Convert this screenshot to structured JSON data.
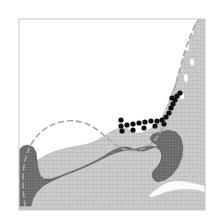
{
  "figure": {
    "domain_label": "map",
    "title": "Coastal bathymetry and transect map",
    "width": 218,
    "height": 224,
    "background_color": "#ffffff"
  },
  "frame": {
    "name": "map-frame",
    "x": 19,
    "y": 19,
    "width": 186,
    "height": 191,
    "stroke_color": "#cfcfcf",
    "stroke_width": 1.2,
    "fill_color": "#ffffff"
  },
  "layers": {
    "ocean": {
      "label": "ocean",
      "color": "#ffffff"
    },
    "land": {
      "label": "land",
      "color": "#c8c8c8",
      "texture_color": "#bdbdbd",
      "texture_opacity": 0.55
    },
    "shelf": {
      "label": "nearshore shelf zone",
      "color": "#6e6e6e"
    },
    "river": {
      "label": "river",
      "color": "#fbfbfb"
    },
    "contour": {
      "label": "offshore contour",
      "color": "#a8a8a8",
      "stroke_width": 1.6,
      "dash_pattern": "5 4"
    },
    "transect": {
      "label": "sampling transect",
      "color": "#101010",
      "dot_radius": 2.6,
      "dot_count": 22
    }
  },
  "geometry": {
    "land_path": "M 205 19 L 205 210 L 19 210 L 19 206 L 24 203 L 28 196 L 30 186 L 31 175 L 33 166 L 38 160 L 46 155 L 56 151 L 67 148 L 78 146 L 88 144 L 96 141 L 103 137 L 109 133 L 114 130 L 120 128 L 126 128 L 131 131 L 136 133 L 142 133 L 147 131 L 152 128 L 157 124 L 161 119 L 164 113 L 167 106 L 170 98 L 173 90 L 176 82 L 179 73 L 182 64 L 185 54 L 188 44 L 191 34 L 194 26 L 197 21 L 200 19 Z",
    "shelf_path": "M 19 206 L 19 150 L 23 146 L 28 145 L 33 147 L 36 152 L 37 160 L 38 168 L 40 175 L 44 179 L 51 179 L 60 176 L 70 172 L 80 168 L 89 164 L 97 160 L 104 156 L 110 152 L 116 149 L 122 147 L 128 147 L 133 149 L 138 151 L 144 151 L 150 149 L 155 147 L 160 145 L 164 142 L 167 139 L 170 135 L 173 133 L 176 133 L 179 136 L 181 141 L 182 148 L 181 156 L 178 164 L 173 171 L 167 176 L 161 179 L 156 180 L 153 178 L 152 174 L 154 170 L 158 166 L 161 161 L 162 155 L 160 150 L 156 147 L 150 146 L 143 147 L 136 149 L 129 150 L 122 151 L 115 153 L 108 156 L 100 160 L 92 164 L 83 168 L 73 172 L 63 176 L 52 181 L 43 186 L 37 192 L 33 199 L 31 206 Z",
    "shelf_bay_path": "M 160 132 L 168 130 L 176 132 L 181 138 L 183 147 L 182 157 L 178 167 L 172 175 L 165 180 L 158 182 L 154 180 L 153 175 L 156 170 L 160 164 L 162 157 L 161 150 L 157 145 L 152 142 L 150 138 L 153 134 Z",
    "river_path": "M 205 186 L 196 184 L 187 182 L 178 181 L 170 182 L 163 185 L 157 189 L 152 193 L 149 196 L 152 197 L 158 195 L 165 192 L 173 190 L 181 189 L 190 189 L 198 190 L 205 192 Z",
    "contour_path": "M 25 206 C 23 192 22 178 24 166 C 26 153 31 142 39 134 C 47 126 57 122 67 121 C 78 120 88 123 96 129 C 103 134 109 140 116 145 C 123 150 131 152 139 150 C 147 148 153 143 158 136 C 163 128 166 119 169 109 C 172 98 175 87 178 76 C 181 65 184 53 188 42 C 191 33 195 25 199 19"
  },
  "transect_points": [
    {
      "x": 121,
      "y": 126
    },
    {
      "x": 127,
      "y": 125
    },
    {
      "x": 133,
      "y": 124
    },
    {
      "x": 139,
      "y": 123
    },
    {
      "x": 145,
      "y": 122
    },
    {
      "x": 151,
      "y": 121
    },
    {
      "x": 157,
      "y": 121
    },
    {
      "x": 162,
      "y": 120
    },
    {
      "x": 166,
      "y": 117
    },
    {
      "x": 169,
      "y": 113
    },
    {
      "x": 171,
      "y": 108
    },
    {
      "x": 173,
      "y": 104
    },
    {
      "x": 175,
      "y": 100
    },
    {
      "x": 177,
      "y": 96
    },
    {
      "x": 180,
      "y": 93
    },
    {
      "x": 121,
      "y": 120
    },
    {
      "x": 122,
      "y": 131
    },
    {
      "x": 133,
      "y": 130
    },
    {
      "x": 144,
      "y": 128
    },
    {
      "x": 155,
      "y": 126
    },
    {
      "x": 164,
      "y": 124
    },
    {
      "x": 172,
      "y": 98
    }
  ],
  "land_texture_dots": [
    {
      "x": 40,
      "y": 196
    },
    {
      "x": 55,
      "y": 190
    },
    {
      "x": 70,
      "y": 185
    },
    {
      "x": 86,
      "y": 181
    },
    {
      "x": 101,
      "y": 178
    },
    {
      "x": 117,
      "y": 176
    },
    {
      "x": 132,
      "y": 174
    },
    {
      "x": 148,
      "y": 172
    },
    {
      "x": 163,
      "y": 170
    },
    {
      "x": 178,
      "y": 168
    },
    {
      "x": 193,
      "y": 166
    },
    {
      "x": 48,
      "y": 205
    },
    {
      "x": 64,
      "y": 201
    },
    {
      "x": 80,
      "y": 198
    },
    {
      "x": 96,
      "y": 195
    },
    {
      "x": 112,
      "y": 193
    },
    {
      "x": 128,
      "y": 191
    },
    {
      "x": 144,
      "y": 189
    },
    {
      "x": 160,
      "y": 187
    },
    {
      "x": 176,
      "y": 185
    },
    {
      "x": 192,
      "y": 183
    },
    {
      "x": 186,
      "y": 40
    },
    {
      "x": 194,
      "y": 52
    },
    {
      "x": 190,
      "y": 68
    },
    {
      "x": 198,
      "y": 84
    },
    {
      "x": 188,
      "y": 100
    },
    {
      "x": 196,
      "y": 116
    },
    {
      "x": 186,
      "y": 132
    },
    {
      "x": 198,
      "y": 148
    },
    {
      "x": 190,
      "y": 160
    },
    {
      "x": 200,
      "y": 174
    },
    {
      "x": 192,
      "y": 200
    },
    {
      "x": 176,
      "y": 204
    },
    {
      "x": 158,
      "y": 202
    },
    {
      "x": 140,
      "y": 205
    },
    {
      "x": 122,
      "y": 203
    },
    {
      "x": 104,
      "y": 206
    },
    {
      "x": 86,
      "y": 204
    },
    {
      "x": 68,
      "y": 207
    },
    {
      "x": 50,
      "y": 200
    },
    {
      "x": 120,
      "y": 160
    },
    {
      "x": 136,
      "y": 162
    },
    {
      "x": 104,
      "y": 166
    },
    {
      "x": 88,
      "y": 170
    },
    {
      "x": 72,
      "y": 175
    },
    {
      "x": 56,
      "y": 180
    },
    {
      "x": 150,
      "y": 196
    },
    {
      "x": 166,
      "y": 198
    },
    {
      "x": 182,
      "y": 194
    },
    {
      "x": 198,
      "y": 196
    }
  ],
  "coast_inlets": [
    {
      "x": 191,
      "y": 30,
      "w": 5,
      "h": 9
    },
    {
      "x": 187,
      "y": 47,
      "w": 4,
      "h": 8
    },
    {
      "x": 192,
      "y": 62,
      "w": 4,
      "h": 7
    },
    {
      "x": 186,
      "y": 78,
      "w": 4,
      "h": 8
    },
    {
      "x": 182,
      "y": 96,
      "w": 4,
      "h": 7
    }
  ]
}
